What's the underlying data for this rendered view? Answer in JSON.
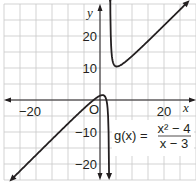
{
  "chart_data": {
    "type": "line",
    "title": "",
    "function_label": "g(x) =",
    "numerator": "x² − 4",
    "denominator": "x − 3",
    "expression": "g(x) = (x^2 - 4)/(x - 3)",
    "xlabel": "x",
    "ylabel": "y",
    "xlim": [
      -30,
      30
    ],
    "ylim": [
      -25,
      30
    ],
    "grid": true,
    "grid_step": 5,
    "x_ticks_labeled": [
      -20,
      20
    ],
    "y_ticks_labeled": [
      20,
      10,
      -10,
      -20
    ],
    "x_tick_labels": [
      "−20",
      "20"
    ],
    "y_tick_labels": [
      "20",
      "10",
      "−10",
      "−20"
    ],
    "origin_label": "O",
    "vertical_asymptote": 3,
    "series": [
      {
        "name": "g(x)",
        "branch": "left",
        "x": [
          -27,
          -25,
          -20,
          -15,
          -10,
          -5,
          -2,
          0,
          1,
          2,
          2.5,
          2.8,
          2.85
        ],
        "values": [
          -24.1,
          -22.1,
          -17.1,
          -12.1,
          -7.4,
          -2.6,
          0,
          1.33,
          1.5,
          0,
          -4.5,
          -19.2,
          -23.9
        ]
      },
      {
        "name": "g(x)",
        "branch": "right",
        "x": [
          3.17,
          3.3,
          3.5,
          4,
          5.24,
          7,
          10,
          15,
          20,
          25,
          27
        ],
        "values": [
          29.6,
          19.6,
          16.5,
          12,
          10.5,
          11.25,
          13.7,
          18.4,
          23.3,
          28.2,
          30.2
        ]
      }
    ],
    "colors": {
      "curve": "#231f20",
      "axis": "#231f20",
      "grid": "#c8c8c8",
      "background": "#ffffff"
    }
  }
}
